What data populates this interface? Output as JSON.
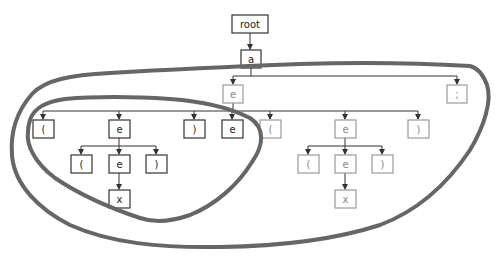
{
  "diagram": {
    "type": "parse-tree",
    "nodes": [
      {
        "id": "root",
        "label": "root",
        "style": "dark"
      },
      {
        "id": "a",
        "label": "a",
        "style": "dark"
      },
      {
        "id": "e1",
        "label": "e",
        "style": "light"
      },
      {
        "id": "semi",
        "label": ";",
        "style": "light"
      },
      {
        "id": "lp1",
        "label": "(",
        "style": "dark"
      },
      {
        "id": "e2",
        "label": "e",
        "style": "dark"
      },
      {
        "id": "rp1",
        "label": ")",
        "style": "dark"
      },
      {
        "id": "e3",
        "label": "e",
        "style": "dark"
      },
      {
        "id": "lp2",
        "label": "(",
        "style": "light"
      },
      {
        "id": "e4",
        "label": "e",
        "style": "light"
      },
      {
        "id": "rp2",
        "label": ")",
        "style": "light"
      },
      {
        "id": "lp3",
        "label": "(",
        "style": "dark"
      },
      {
        "id": "e5",
        "label": "e",
        "style": "dark"
      },
      {
        "id": "rp3",
        "label": ")",
        "style": "dark"
      },
      {
        "id": "lp4",
        "label": "(",
        "style": "light"
      },
      {
        "id": "e6",
        "label": "e",
        "style": "light"
      },
      {
        "id": "rp4",
        "label": ")",
        "style": "light"
      },
      {
        "id": "x1",
        "label": "x",
        "style": "dark"
      },
      {
        "id": "x2",
        "label": "x",
        "style": "light"
      }
    ],
    "edges": [
      [
        "root",
        "a"
      ],
      [
        "a",
        "e1"
      ],
      [
        "a",
        "semi"
      ],
      [
        "e1",
        "lp1"
      ],
      [
        "e1",
        "e2"
      ],
      [
        "e1",
        "rp1"
      ],
      [
        "e1",
        "e3"
      ],
      [
        "e1",
        "lp2"
      ],
      [
        "e1",
        "e4"
      ],
      [
        "e1",
        "rp2"
      ],
      [
        "e2",
        "lp3"
      ],
      [
        "e2",
        "e5"
      ],
      [
        "e2",
        "rp3"
      ],
      [
        "e4",
        "lp4"
      ],
      [
        "e4",
        "e6"
      ],
      [
        "e4",
        "rp4"
      ],
      [
        "e5",
        "x1"
      ],
      [
        "e6",
        "x2"
      ]
    ],
    "regions": [
      {
        "id": "outer-region",
        "description": "large freehand outline enclosing subtree of a (excluding root)"
      },
      {
        "id": "inner-region",
        "description": "freehand outline enclosing ( e ) subtree on the left"
      }
    ]
  }
}
